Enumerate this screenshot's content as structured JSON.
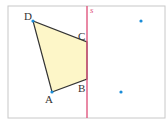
{
  "diagram": {
    "frame": {
      "x": 8,
      "y": 6,
      "w": 157,
      "h": 112,
      "stroke": "#c8c8c8"
    },
    "mirror_line": {
      "label": "s",
      "x": 87,
      "y1": 6,
      "y2": 118,
      "color": "#e0577f"
    },
    "quadrilateral": {
      "fill": "#fdf6c8",
      "stroke": "#333333",
      "points": {
        "A": {
          "x": 52,
          "y": 92
        },
        "B": {
          "x": 87,
          "y": 79
        },
        "C": {
          "x": 87,
          "y": 42
        },
        "D": {
          "x": 33,
          "y": 21
        }
      }
    },
    "labels": {
      "A": "A",
      "B": "B",
      "C": "C",
      "D": "D"
    },
    "dots": [
      {
        "x": 141,
        "y": 21,
        "color": "#1a8cd8"
      },
      {
        "x": 121,
        "y": 92,
        "color": "#1a8cd8"
      }
    ],
    "vertex_dot_color": "#1a8cd8"
  }
}
